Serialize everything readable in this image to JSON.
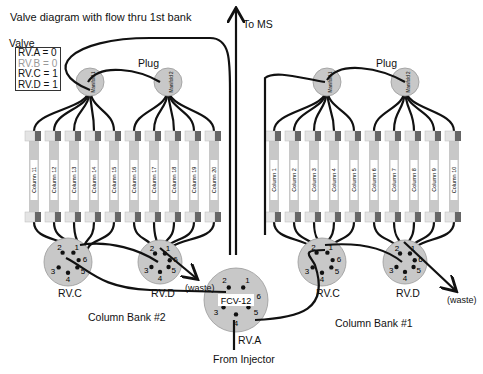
{
  "title": "Valve diagram with flow thru 1st bank",
  "legend": {
    "heading": "Valve",
    "items": [
      {
        "label": "RV.A = 0",
        "active": true
      },
      {
        "label": "RV.B = 0",
        "active": false
      },
      {
        "label": "RV.C = 1",
        "active": true
      },
      {
        "label": "RV.D = 1",
        "active": true
      }
    ]
  },
  "labels": {
    "to_ms": "To MS",
    "from_injector": "From Injector",
    "plug_left": "Plug",
    "plug_right": "Plug",
    "waste_left": "(waste)",
    "waste_right": "(waste)",
    "bank2": "Column Bank #2",
    "bank1": "Column Bank #1",
    "rvc_left": "RV.C",
    "rvd_left": "RV.D",
    "rvc_right": "RV.C",
    "rvd_right": "RV.D",
    "rva": "RV.A",
    "fcv": "FCV-12"
  },
  "manifolds": [
    "Manifold 1",
    "Manifold 2",
    "Manifold 1",
    "Manifold 2"
  ],
  "bank2_columns": [
    "Column 11",
    "Column 12",
    "Column 13",
    "Column 14",
    "Column 15",
    "Column 16",
    "Column 17",
    "Column 18",
    "Column 19",
    "Column 20"
  ],
  "bank1_columns": [
    "Column 1",
    "Column 2",
    "Column 3",
    "Column 4",
    "Column 5",
    "Column 6",
    "Column 7",
    "Column 8",
    "Column 9",
    "Column 10"
  ],
  "valve_ports": [
    "1",
    "2",
    "3",
    "4",
    "5",
    "6"
  ],
  "colors": {
    "valve_fill": "#c8c8c8",
    "column_fill": "#c8c8c8",
    "cap_dark": "#666666",
    "line": "#111111"
  }
}
